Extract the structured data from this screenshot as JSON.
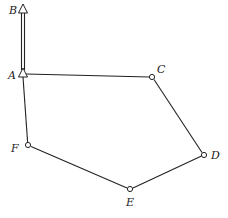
{
  "diagram": {
    "type": "graph",
    "nodes": [
      {
        "id": "A",
        "label": "A",
        "x": 23,
        "y": 73,
        "marker": "triangle",
        "label_x": 8,
        "label_y": 79
      },
      {
        "id": "B",
        "label": "B",
        "x": 23,
        "y": 9,
        "marker": "triangle",
        "label_x": 9,
        "label_y": 14
      },
      {
        "id": "C",
        "label": "C",
        "x": 152,
        "y": 77,
        "marker": "circle",
        "label_x": 157,
        "label_y": 73
      },
      {
        "id": "D",
        "label": "D",
        "x": 204,
        "y": 155,
        "marker": "circle",
        "label_x": 211,
        "label_y": 159
      },
      {
        "id": "E",
        "label": "E",
        "x": 130,
        "y": 189,
        "marker": "circle",
        "label_x": 126,
        "label_y": 206
      },
      {
        "id": "F",
        "label": "F",
        "x": 28,
        "y": 145,
        "marker": "circle",
        "label_x": 11,
        "label_y": 152
      }
    ],
    "edges": [
      {
        "from": "A",
        "to": "B",
        "style": "double"
      },
      {
        "from": "A",
        "to": "C",
        "style": "single"
      },
      {
        "from": "C",
        "to": "D",
        "style": "single"
      },
      {
        "from": "D",
        "to": "E",
        "style": "single"
      },
      {
        "from": "E",
        "to": "F",
        "style": "single"
      },
      {
        "from": "F",
        "to": "A",
        "style": "single"
      }
    ]
  }
}
